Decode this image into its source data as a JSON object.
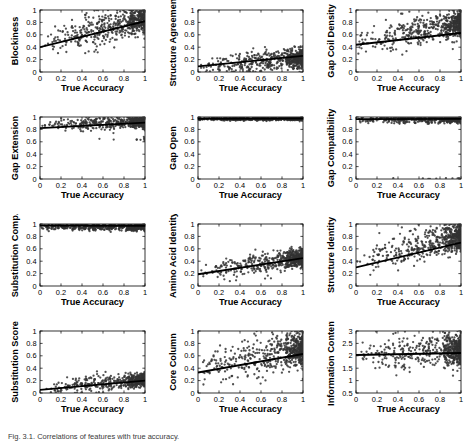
{
  "figure": {
    "caption": "Fig. 3.1. Correlations of features with true accuracy.",
    "panel_count": 12,
    "columns": 3,
    "rows": 4,
    "marker_color": "#333333",
    "line_color": "#000000",
    "axis_color": "#000000",
    "background": "#ffffff",
    "shared_xlabel": "True Accuracy"
  },
  "chart_data": [
    {
      "type": "scatter",
      "title": "",
      "xlabel": "True Accuracy",
      "ylabel": "Blockiness",
      "xlim": [
        0,
        1
      ],
      "ylim": [
        0,
        1
      ],
      "xticks": [
        0,
        0.2,
        0.4,
        0.6,
        0.8,
        1
      ],
      "yticks": [
        0,
        0.2,
        0.4,
        0.6,
        0.8,
        1
      ],
      "xticklabels": [
        "0",
        "0.2",
        "0.4",
        "0.6",
        "0.8",
        "1"
      ],
      "yticklabels": [
        "0",
        "0.2",
        "0.4",
        "0.6",
        "0.8",
        "1"
      ],
      "grid": false,
      "n_points": 620,
      "fit_line": {
        "intercept": 0.4,
        "slope": 0.42
      },
      "scatter_model": {
        "y_at_x0": 0.46,
        "y_at_x1": 0.86,
        "noise": 0.115,
        "x_skew": 1.7,
        "cluster_right": 0.4
      }
    },
    {
      "type": "scatter",
      "title": "",
      "xlabel": "True Accuracy",
      "ylabel": "Structure Agreement",
      "xlim": [
        0,
        1
      ],
      "ylim": [
        0,
        1
      ],
      "xticks": [
        0,
        0.2,
        0.4,
        0.6,
        0.8,
        1
      ],
      "yticks": [
        0,
        0.2,
        0.4,
        0.6,
        0.8,
        1
      ],
      "xticklabels": [
        "0",
        "0.2",
        "0.4",
        "0.6",
        "0.8",
        "1"
      ],
      "yticklabels": [
        "0",
        "0.2",
        "0.4",
        "0.6",
        "0.8",
        "1"
      ],
      "grid": false,
      "n_points": 620,
      "fit_line": {
        "intercept": 0.09,
        "slope": 0.17
      },
      "scatter_model": {
        "y_at_x0": 0.08,
        "y_at_x1": 0.22,
        "noise": 0.075,
        "x_skew": 1.7,
        "cluster_right": 0.45
      }
    },
    {
      "type": "scatter",
      "title": "",
      "xlabel": "True Accuracy",
      "ylabel": "Gap Coil Density",
      "xlim": [
        0,
        1
      ],
      "ylim": [
        0,
        1
      ],
      "xticks": [
        0,
        0.2,
        0.4,
        0.6,
        0.8,
        1
      ],
      "yticks": [
        0,
        0.2,
        0.4,
        0.6,
        0.8,
        1
      ],
      "xticklabels": [
        "0",
        "0.2",
        "0.4",
        "0.6",
        "0.8",
        "1"
      ],
      "yticklabels": [
        "0",
        "0.2",
        "0.4",
        "0.6",
        "0.8",
        "1"
      ],
      "grid": false,
      "n_points": 620,
      "fit_line": {
        "intercept": 0.44,
        "slope": 0.19
      },
      "scatter_model": {
        "y_at_x0": 0.46,
        "y_at_x1": 0.78,
        "noise": 0.1,
        "x_skew": 1.7,
        "cluster_right": 0.45
      }
    },
    {
      "type": "scatter",
      "title": "",
      "xlabel": "True Accuracy",
      "ylabel": "Gap Extension",
      "xlim": [
        0,
        1
      ],
      "ylim": [
        0,
        1
      ],
      "xticks": [
        0,
        0.2,
        0.4,
        0.6,
        0.8,
        1
      ],
      "yticks": [
        0,
        0.2,
        0.4,
        0.6,
        0.8,
        1
      ],
      "xticklabels": [
        "0",
        "0.2",
        "0.4",
        "0.6",
        "0.8",
        "1"
      ],
      "yticklabels": [
        "0",
        "0.2",
        "0.4",
        "0.6",
        "0.8",
        "1"
      ],
      "grid": false,
      "n_points": 620,
      "fit_line": {
        "intercept": 0.82,
        "slope": 0.09
      },
      "scatter_model": {
        "y_at_x0": 0.85,
        "y_at_x1": 0.93,
        "noise": 0.045,
        "x_skew": 1.7,
        "cluster_right": 0.45,
        "outlier_low": 0.64
      }
    },
    {
      "type": "scatter",
      "title": "",
      "xlabel": "True Accuracy",
      "ylabel": "Gap Open",
      "xlim": [
        0,
        1
      ],
      "ylim": [
        0,
        1
      ],
      "xticks": [
        0,
        0.2,
        0.4,
        0.6,
        0.8,
        1
      ],
      "yticks": [
        0,
        0.2,
        0.4,
        0.6,
        0.8,
        1
      ],
      "xticklabels": [
        "0",
        "0.2",
        "0.4",
        "0.6",
        "0.8",
        "1"
      ],
      "yticklabels": [
        "0",
        "0.2",
        "0.4",
        "0.6",
        "0.8",
        "1"
      ],
      "grid": false,
      "n_points": 620,
      "fit_line": {
        "intercept": 0.972,
        "slope": 0.004
      },
      "scatter_model": {
        "y_at_x0": 0.968,
        "y_at_x1": 0.972,
        "noise": 0.012,
        "x_skew": 1.4,
        "cluster_right": 0.35
      }
    },
    {
      "type": "scatter",
      "title": "",
      "xlabel": "True Accuracy",
      "ylabel": "Gap Compatibility",
      "xlim": [
        0,
        1
      ],
      "ylim": [
        0,
        1
      ],
      "xticks": [
        0,
        0.2,
        0.4,
        0.6,
        0.8,
        1
      ],
      "yticks": [
        0,
        0.2,
        0.4,
        0.6,
        0.8,
        1
      ],
      "xticklabels": [
        "0",
        "0.2",
        "0.4",
        "0.6",
        "0.8",
        "1"
      ],
      "yticklabels": [
        "0",
        "0.2",
        "0.4",
        "0.6",
        "0.8",
        "1"
      ],
      "grid": false,
      "n_points": 620,
      "fit_line": {
        "intercept": 0.965,
        "slope": 0.005
      },
      "scatter_model": {
        "y_at_x0": 0.955,
        "y_at_x1": 0.965,
        "noise": 0.028,
        "x_skew": 1.5,
        "cluster_right": 0.4,
        "outlier_zero": true
      }
    },
    {
      "type": "scatter",
      "title": "",
      "xlabel": "True Accuracy",
      "ylabel": "Substitution Comp.",
      "xlim": [
        0,
        1
      ],
      "ylim": [
        0,
        1
      ],
      "xticks": [
        0,
        0.2,
        0.4,
        0.6,
        0.8,
        1
      ],
      "yticks": [
        0,
        0.2,
        0.4,
        0.6,
        0.8,
        1
      ],
      "xticklabels": [
        "0",
        "0.2",
        "0.4",
        "0.6",
        "0.8",
        "1"
      ],
      "yticklabels": [
        "0",
        "0.2",
        "0.4",
        "0.6",
        "0.8",
        "1"
      ],
      "grid": false,
      "n_points": 620,
      "fit_line": {
        "intercept": 0.975,
        "slope": -0.004
      },
      "scatter_model": {
        "y_at_x0": 0.955,
        "y_at_x1": 0.95,
        "noise": 0.025,
        "x_skew": 1.5,
        "cluster_right": 0.38
      }
    },
    {
      "type": "scatter",
      "title": "",
      "xlabel": "True Accuracy",
      "ylabel": "Amino Acid Identity",
      "xlim": [
        0,
        1
      ],
      "ylim": [
        0,
        1
      ],
      "xticks": [
        0,
        0.2,
        0.4,
        0.6,
        0.8,
        1
      ],
      "yticks": [
        0,
        0.2,
        0.4,
        0.6,
        0.8,
        1
      ],
      "xticklabels": [
        "0",
        "0.2",
        "0.4",
        "0.6",
        "0.8",
        "1"
      ],
      "yticklabels": [
        "0",
        "0.2",
        "0.4",
        "0.6",
        "0.8",
        "1"
      ],
      "grid": false,
      "n_points": 620,
      "fit_line": {
        "intercept": 0.19,
        "slope": 0.26
      },
      "scatter_model": {
        "y_at_x0": 0.21,
        "y_at_x1": 0.46,
        "noise": 0.075,
        "x_skew": 1.7,
        "cluster_right": 0.45
      }
    },
    {
      "type": "scatter",
      "title": "",
      "xlabel": "True Accuracy",
      "ylabel": "Structure Identity",
      "xlim": [
        0,
        1
      ],
      "ylim": [
        0,
        1
      ],
      "xticks": [
        0,
        0.2,
        0.4,
        0.6,
        0.8,
        1
      ],
      "yticks": [
        0,
        0.2,
        0.4,
        0.6,
        0.8,
        1
      ],
      "xticklabels": [
        "0",
        "0.2",
        "0.4",
        "0.6",
        "0.8",
        "1"
      ],
      "yticklabels": [
        "0",
        "0.2",
        "0.4",
        "0.6",
        "0.8",
        "1"
      ],
      "grid": false,
      "n_points": 620,
      "fit_line": {
        "intercept": 0.3,
        "slope": 0.4
      },
      "scatter_model": {
        "y_at_x0": 0.36,
        "y_at_x1": 0.8,
        "noise": 0.115,
        "x_skew": 1.7,
        "cluster_right": 0.42
      }
    },
    {
      "type": "scatter",
      "title": "",
      "xlabel": "True Accuracy",
      "ylabel": "Substitution Score",
      "xlim": [
        0,
        1
      ],
      "ylim": [
        0,
        1
      ],
      "xticks": [
        0,
        0.2,
        0.4,
        0.6,
        0.8,
        1
      ],
      "yticks": [
        0,
        0.2,
        0.4,
        0.6,
        0.8,
        1
      ],
      "xticklabels": [
        "0",
        "0.2",
        "0.4",
        "0.6",
        "0.8",
        "1"
      ],
      "yticklabels": [
        "0",
        "0.2",
        "0.4",
        "0.6",
        "0.8",
        "1"
      ],
      "grid": false,
      "n_points": 620,
      "fit_line": {
        "intercept": 0.05,
        "slope": 0.15
      },
      "scatter_model": {
        "y_at_x0": 0.06,
        "y_at_x1": 0.22,
        "noise": 0.055,
        "x_skew": 1.8,
        "cluster_right": 0.5
      }
    },
    {
      "type": "scatter",
      "title": "",
      "xlabel": "True Accuracy",
      "ylabel": "Core Column",
      "xlim": [
        0,
        1
      ],
      "ylim": [
        0,
        1
      ],
      "xticks": [
        0,
        0.2,
        0.4,
        0.6,
        0.8,
        1
      ],
      "yticks": [
        0,
        0.2,
        0.4,
        0.6,
        0.8,
        1
      ],
      "xticklabels": [
        "0",
        "0.2",
        "0.4",
        "0.6",
        "0.8",
        "1"
      ],
      "yticklabels": [
        "0",
        "0.2",
        "0.4",
        "0.6",
        "0.8",
        "1"
      ],
      "grid": false,
      "n_points": 620,
      "fit_line": {
        "intercept": 0.33,
        "slope": 0.3
      },
      "scatter_model": {
        "y_at_x0": 0.38,
        "y_at_x1": 0.72,
        "noise": 0.135,
        "x_skew": 1.7,
        "cluster_right": 0.42
      }
    },
    {
      "type": "scatter",
      "title": "",
      "xlabel": "True Accuracy",
      "ylabel": "Information Content",
      "xlim": [
        0,
        1
      ],
      "ylim": [
        0.5,
        3
      ],
      "xticks": [
        0,
        0.2,
        0.4,
        0.6,
        0.8,
        1
      ],
      "yticks": [
        0.5,
        1,
        1.5,
        2,
        2.5,
        3
      ],
      "xticklabels": [
        "0",
        "0.2",
        "0.4",
        "0.6",
        "0.8",
        "1"
      ],
      "yticklabels": [
        "0.5",
        "1",
        "1.5",
        "2",
        "2.5",
        "3"
      ],
      "grid": false,
      "n_points": 620,
      "fit_line": {
        "intercept": 2.03,
        "slope": 0.08
      },
      "scatter_model": {
        "y_at_x0": 2.05,
        "y_at_x1": 2.25,
        "noise": 0.3,
        "x_skew": 1.7,
        "cluster_right": 0.45
      }
    }
  ]
}
